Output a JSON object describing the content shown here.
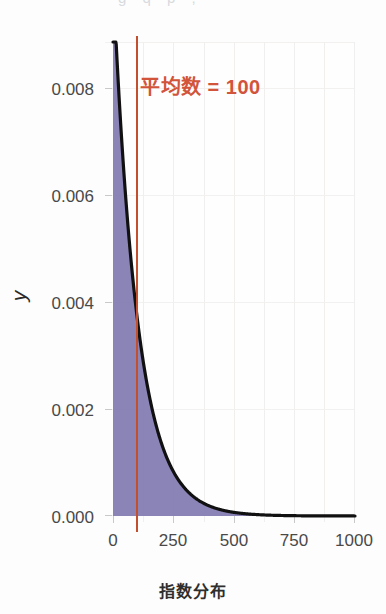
{
  "top_crop": {
    "text": "g q p ,"
  },
  "chart_data": {
    "type": "area",
    "title": "",
    "subtitle": "",
    "xlabel": "指数分布",
    "ylabel": "y",
    "xlim": [
      0,
      1000
    ],
    "ylim": [
      0.0,
      0.0088
    ],
    "grid": true,
    "legend": "none",
    "x_ticks": [
      "0",
      "250",
      "500",
      "750",
      "1000"
    ],
    "x_tick_values": [
      0,
      250,
      500,
      750,
      1000
    ],
    "y_ticks": [
      "0.000",
      "0.002",
      "0.004",
      "0.006",
      "0.008"
    ],
    "y_tick_values": [
      0.0,
      0.002,
      0.004,
      0.006,
      0.008
    ],
    "distribution": "exponential",
    "rate": 0.01,
    "mean": 100,
    "curve_color": "#111111",
    "fill_color": "#8179b0",
    "annotation": {
      "label": "平均数 = 100",
      "value": 100,
      "color": "#d2543a",
      "line_color": "#c2502f"
    },
    "x": [
      0,
      25,
      50,
      75,
      100,
      125,
      150,
      175,
      200,
      250,
      300,
      350,
      400,
      450,
      500,
      600,
      700,
      800,
      900,
      1000
    ],
    "values": [
      0.0088,
      0.00778,
      0.00607,
      0.00473,
      0.00368,
      0.00287,
      0.00223,
      0.00174,
      0.00135,
      0.00082,
      0.0005,
      0.0003,
      0.00018,
      0.00011,
      7e-05,
      2.5e-05,
      9e-06,
      3e-06,
      1e-06,
      5e-07
    ]
  }
}
